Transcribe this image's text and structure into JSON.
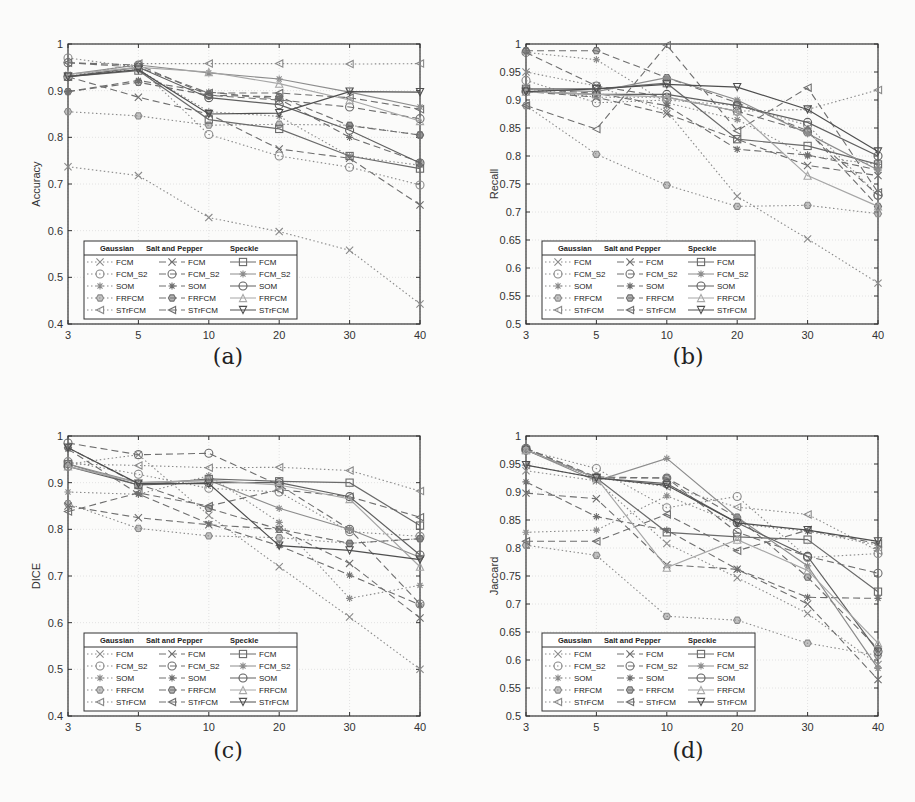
{
  "figure": {
    "captions": [
      "(a)",
      "(b)",
      "(c)",
      "(d)"
    ]
  },
  "legend": {
    "headers": [
      "Gaussian",
      "Salt and Pepper",
      "Speckle"
    ],
    "methods": [
      "FCM",
      "FCM_S2",
      "SOM",
      "FRFCM",
      "STrFCM"
    ]
  },
  "chart_data": [
    {
      "id": "a",
      "type": "line",
      "caption": "(a)",
      "title": "",
      "xlabel": "Noise Density",
      "ylabel": "Accuracy",
      "x": [
        3,
        5,
        10,
        20,
        30,
        40
      ],
      "xticks": [
        "3",
        "5",
        "10",
        "20",
        "30",
        "40"
      ],
      "ylim": [
        0.4,
        1.0
      ],
      "yticks": [
        "0.4",
        "0.5",
        "0.6",
        "0.7",
        "0.8",
        "0.9",
        "1"
      ],
      "grid": true,
      "legend_position": "lower left",
      "series": [
        {
          "name": "Gaussian FCM",
          "noise": "Gaussian",
          "method": "FCM",
          "values": [
            0.737,
            0.718,
            0.628,
            0.598,
            0.558,
            0.443
          ]
        },
        {
          "name": "Gaussian FCM_S2",
          "noise": "Gaussian",
          "method": "FCM_S2",
          "values": [
            0.97,
            0.95,
            0.806,
            0.76,
            0.736,
            0.698
          ]
        },
        {
          "name": "Gaussian SOM",
          "noise": "Gaussian",
          "method": "SOM",
          "values": [
            0.935,
            0.945,
            0.855,
            0.845,
            0.76,
            0.74
          ]
        },
        {
          "name": "Gaussian FRFCM",
          "noise": "Gaussian",
          "method": "FRFCM",
          "values": [
            0.855,
            0.846,
            0.826,
            0.828,
            0.826,
            0.805
          ]
        },
        {
          "name": "Gaussian STrFCM",
          "noise": "Gaussian",
          "method": "STrFCM",
          "values": [
            0.93,
            0.958,
            0.958,
            0.958,
            0.957,
            0.958
          ]
        },
        {
          "name": "Salt and Pepper FCM",
          "noise": "Salt and Pepper",
          "method": "FCM",
          "values": [
            0.93,
            0.886,
            0.85,
            0.775,
            0.755,
            0.655
          ]
        },
        {
          "name": "Salt and Pepper FCM_S2",
          "noise": "Salt and Pepper",
          "method": "FCM_S2",
          "values": [
            0.96,
            0.955,
            0.89,
            0.88,
            0.865,
            0.84
          ]
        },
        {
          "name": "Salt and Pepper SOM",
          "noise": "Salt and Pepper",
          "method": "SOM",
          "values": [
            0.898,
            0.922,
            0.897,
            0.882,
            0.8,
            0.747
          ]
        },
        {
          "name": "Salt and Pepper FRFCM",
          "noise": "Salt and Pepper",
          "method": "FRFCM",
          "values": [
            0.898,
            0.918,
            0.89,
            0.887,
            0.825,
            0.805
          ]
        },
        {
          "name": "Salt and Pepper STrFCM",
          "noise": "Salt and Pepper",
          "method": "STrFCM",
          "values": [
            0.96,
            0.95,
            0.895,
            0.895,
            0.885,
            0.86
          ]
        },
        {
          "name": "Speckle FCM",
          "noise": "Speckle",
          "method": "FCM",
          "values": [
            0.93,
            0.943,
            0.838,
            0.818,
            0.76,
            0.733
          ]
        },
        {
          "name": "Speckle FCM_S2",
          "noise": "Speckle",
          "method": "FCM_S2",
          "values": [
            0.935,
            0.955,
            0.938,
            0.925,
            0.897,
            0.865
          ]
        },
        {
          "name": "Speckle SOM",
          "noise": "Speckle",
          "method": "SOM",
          "values": [
            0.93,
            0.95,
            0.885,
            0.87,
            0.815,
            0.745
          ]
        },
        {
          "name": "Speckle FRFCM",
          "noise": "Speckle",
          "method": "FRFCM",
          "values": [
            0.935,
            0.95,
            0.94,
            0.915,
            0.88,
            0.835
          ]
        },
        {
          "name": "Speckle STrFCM",
          "noise": "Speckle",
          "method": "STrFCM",
          "values": [
            0.93,
            0.945,
            0.85,
            0.852,
            0.898,
            0.897
          ]
        }
      ]
    },
    {
      "id": "b",
      "type": "line",
      "caption": "(b)",
      "title": "",
      "xlabel": "Noise Density",
      "ylabel": "Recall",
      "x": [
        3,
        5,
        10,
        20,
        30,
        40
      ],
      "xticks": [
        "3",
        "5",
        "10",
        "20",
        "30",
        "40"
      ],
      "ylim": [
        0.5,
        1.0
      ],
      "yticks": [
        "0.5",
        "0.55",
        "0.6",
        "0.65",
        "0.7",
        "0.75",
        "0.8",
        "0.85",
        "0.9",
        "0.95",
        "1"
      ],
      "grid": true,
      "legend_position": "lower left",
      "series": [
        {
          "name": "Gaussian FCM",
          "noise": "Gaussian",
          "method": "FCM",
          "values": [
            0.95,
            0.925,
            0.88,
            0.728,
            0.652,
            0.573
          ]
        },
        {
          "name": "Gaussian FCM_S2",
          "noise": "Gaussian",
          "method": "FCM_S2",
          "values": [
            0.935,
            0.895,
            0.9,
            0.89,
            0.855,
            0.73
          ]
        },
        {
          "name": "Gaussian SOM",
          "noise": "Gaussian",
          "method": "SOM",
          "values": [
            0.985,
            0.972,
            0.895,
            0.865,
            0.8,
            0.785
          ]
        },
        {
          "name": "Gaussian FRFCM",
          "noise": "Gaussian",
          "method": "FRFCM",
          "values": [
            0.89,
            0.803,
            0.748,
            0.71,
            0.712,
            0.697
          ]
        },
        {
          "name": "Gaussian STrFCM",
          "noise": "Gaussian",
          "method": "STrFCM",
          "values": [
            0.92,
            0.905,
            0.905,
            0.88,
            0.883,
            0.918
          ]
        },
        {
          "name": "Salt and Pepper FCM",
          "noise": "Salt and Pepper",
          "method": "FCM",
          "values": [
            0.915,
            0.905,
            0.875,
            0.83,
            0.783,
            0.765
          ]
        },
        {
          "name": "Salt and Pepper FCM_S2",
          "noise": "Salt and Pepper",
          "method": "FCM_S2",
          "values": [
            0.985,
            0.925,
            0.905,
            0.88,
            0.843,
            0.73
          ]
        },
        {
          "name": "Salt and Pepper SOM",
          "noise": "Salt and Pepper",
          "method": "SOM",
          "values": [
            0.92,
            0.912,
            0.89,
            0.812,
            0.802,
            0.775
          ]
        },
        {
          "name": "Salt and Pepper FRFCM",
          "noise": "Salt and Pepper",
          "method": "FRFCM",
          "values": [
            0.988,
            0.988,
            0.94,
            0.895,
            0.845,
            0.71
          ]
        },
        {
          "name": "Salt and Pepper STrFCM",
          "noise": "Salt and Pepper",
          "method": "STrFCM",
          "values": [
            0.89,
            0.848,
            0.998,
            0.845,
            0.922,
            0.735
          ]
        },
        {
          "name": "Speckle FCM",
          "noise": "Speckle",
          "method": "FCM",
          "values": [
            0.92,
            0.92,
            0.93,
            0.83,
            0.818,
            0.785
          ]
        },
        {
          "name": "Speckle FCM_S2",
          "noise": "Speckle",
          "method": "FCM_S2",
          "values": [
            0.92,
            0.915,
            0.94,
            0.9,
            0.84,
            0.775
          ]
        },
        {
          "name": "Speckle SOM",
          "noise": "Speckle",
          "method": "SOM",
          "values": [
            0.915,
            0.91,
            0.91,
            0.89,
            0.86,
            0.8
          ]
        },
        {
          "name": "Speckle FRFCM",
          "noise": "Speckle",
          "method": "FRFCM",
          "values": [
            0.915,
            0.91,
            0.905,
            0.88,
            0.765,
            0.71
          ]
        },
        {
          "name": "Speckle STrFCM",
          "noise": "Speckle",
          "method": "STrFCM",
          "values": [
            0.915,
            0.92,
            0.928,
            0.923,
            0.883,
            0.808
          ]
        }
      ]
    },
    {
      "id": "c",
      "type": "line",
      "caption": "(c)",
      "title": "",
      "xlabel": "Noise Density",
      "ylabel": "DICE",
      "x": [
        3,
        5,
        10,
        20,
        30,
        40
      ],
      "xticks": [
        "3",
        "5",
        "10",
        "20",
        "30",
        "40"
      ],
      "ylim": [
        0.4,
        1.0
      ],
      "yticks": [
        "0.4",
        "0.5",
        "0.6",
        "0.7",
        "0.8",
        "0.9",
        "1"
      ],
      "grid": true,
      "legend_position": "lower left",
      "series": [
        {
          "name": "Gaussian FCM",
          "noise": "Gaussian",
          "method": "FCM",
          "values": [
            0.94,
            0.96,
            0.83,
            0.72,
            0.612,
            0.5
          ]
        },
        {
          "name": "Gaussian FCM_S2",
          "noise": "Gaussian",
          "method": "FCM_S2",
          "values": [
            0.945,
            0.918,
            0.888,
            0.88,
            0.795,
            0.785
          ]
        },
        {
          "name": "Gaussian SOM",
          "noise": "Gaussian",
          "method": "SOM",
          "values": [
            0.88,
            0.875,
            0.915,
            0.815,
            0.652,
            0.68
          ]
        },
        {
          "name": "Gaussian FRFCM",
          "noise": "Gaussian",
          "method": "FRFCM",
          "values": [
            0.855,
            0.802,
            0.786,
            0.782,
            0.77,
            0.78
          ]
        },
        {
          "name": "Gaussian STrFCM",
          "noise": "Gaussian",
          "method": "STrFCM",
          "values": [
            0.94,
            0.937,
            0.932,
            0.933,
            0.926,
            0.882
          ]
        },
        {
          "name": "Salt and Pepper FCM",
          "noise": "Salt and Pepper",
          "method": "FCM",
          "values": [
            0.85,
            0.825,
            0.81,
            0.8,
            0.727,
            0.61
          ]
        },
        {
          "name": "Salt and Pepper FCM_S2",
          "noise": "Salt and Pepper",
          "method": "FCM_S2",
          "values": [
            0.985,
            0.96,
            0.963,
            0.895,
            0.8,
            0.64
          ]
        },
        {
          "name": "Salt and Pepper SOM",
          "noise": "Salt and Pepper",
          "method": "SOM",
          "values": [
            0.972,
            0.876,
            0.812,
            0.765,
            0.702,
            0.638
          ]
        },
        {
          "name": "Salt and Pepper FRFCM",
          "noise": "Salt and Pepper",
          "method": "FRFCM",
          "values": [
            0.975,
            0.897,
            0.845,
            0.8,
            0.77,
            0.78
          ]
        },
        {
          "name": "Salt and Pepper STrFCM",
          "noise": "Salt and Pepper",
          "method": "STrFCM",
          "values": [
            0.838,
            0.878,
            0.85,
            0.885,
            0.87,
            0.826
          ]
        },
        {
          "name": "Speckle FCM",
          "noise": "Speckle",
          "method": "FCM",
          "values": [
            0.94,
            0.895,
            0.908,
            0.903,
            0.9,
            0.808
          ]
        },
        {
          "name": "Speckle FCM_S2",
          "noise": "Speckle",
          "method": "FCM_S2",
          "values": [
            0.94,
            0.9,
            0.905,
            0.845,
            0.8,
            0.74
          ]
        },
        {
          "name": "Speckle SOM",
          "noise": "Speckle",
          "method": "SOM",
          "values": [
            0.935,
            0.895,
            0.9,
            0.9,
            0.87,
            0.745
          ]
        },
        {
          "name": "Speckle FRFCM",
          "noise": "Speckle",
          "method": "FRFCM",
          "values": [
            0.935,
            0.9,
            0.905,
            0.895,
            0.865,
            0.72
          ]
        },
        {
          "name": "Speckle STrFCM",
          "noise": "Speckle",
          "method": "STrFCM",
          "values": [
            0.975,
            0.898,
            0.898,
            0.765,
            0.755,
            0.735
          ]
        }
      ]
    },
    {
      "id": "d",
      "type": "line",
      "caption": "(d)",
      "title": "",
      "xlabel": "Noise Density",
      "ylabel": "Jaccard",
      "x": [
        3,
        5,
        10,
        20,
        30,
        40
      ],
      "xticks": [
        "3",
        "5",
        "10",
        "20",
        "30",
        "40"
      ],
      "ylim": [
        0.5,
        1.0
      ],
      "yticks": [
        "0.5",
        "0.55",
        "0.6",
        "0.65",
        "0.7",
        "0.75",
        "0.8",
        "0.85",
        "0.9",
        "0.95",
        "1"
      ],
      "grid": true,
      "legend_position": "lower left",
      "series": [
        {
          "name": "Gaussian FCM",
          "noise": "Gaussian",
          "method": "FCM",
          "values": [
            0.938,
            0.92,
            0.808,
            0.747,
            0.683,
            0.592
          ]
        },
        {
          "name": "Gaussian FCM_S2",
          "noise": "Gaussian",
          "method": "FCM_S2",
          "values": [
            0.975,
            0.942,
            0.872,
            0.892,
            0.783,
            0.79
          ]
        },
        {
          "name": "Gaussian SOM",
          "noise": "Gaussian",
          "method": "SOM",
          "values": [
            0.828,
            0.832,
            0.893,
            0.843,
            0.83,
            0.805
          ]
        },
        {
          "name": "Gaussian FRFCM",
          "noise": "Gaussian",
          "method": "FRFCM",
          "values": [
            0.805,
            0.787,
            0.678,
            0.671,
            0.63,
            0.608
          ]
        },
        {
          "name": "Gaussian STrFCM",
          "noise": "Gaussian",
          "method": "STrFCM",
          "values": [
            0.948,
            0.925,
            0.91,
            0.873,
            0.86,
            0.795
          ]
        },
        {
          "name": "Salt and Pepper FCM",
          "noise": "Salt and Pepper",
          "method": "FCM",
          "values": [
            0.898,
            0.888,
            0.77,
            0.762,
            0.7,
            0.565
          ]
        },
        {
          "name": "Salt and Pepper FCM_S2",
          "noise": "Salt and Pepper",
          "method": "FCM_S2",
          "values": [
            0.978,
            0.925,
            0.925,
            0.828,
            0.785,
            0.755
          ]
        },
        {
          "name": "Salt and Pepper SOM",
          "noise": "Salt and Pepper",
          "method": "SOM",
          "values": [
            0.918,
            0.856,
            0.832,
            0.762,
            0.712,
            0.71
          ]
        },
        {
          "name": "Salt and Pepper FRFCM",
          "noise": "Salt and Pepper",
          "method": "FRFCM",
          "values": [
            0.978,
            0.927,
            0.925,
            0.855,
            0.748,
            0.62
          ]
        },
        {
          "name": "Salt and Pepper STrFCM",
          "noise": "Salt and Pepper",
          "method": "STrFCM",
          "values": [
            0.812,
            0.812,
            0.86,
            0.795,
            0.832,
            0.808
          ]
        },
        {
          "name": "Speckle FCM",
          "noise": "Speckle",
          "method": "FCM",
          "values": [
            0.975,
            0.925,
            0.828,
            0.82,
            0.815,
            0.722
          ]
        },
        {
          "name": "Speckle FCM_S2",
          "noise": "Speckle",
          "method": "FCM_S2",
          "values": [
            0.975,
            0.92,
            0.96,
            0.855,
            0.768,
            0.585
          ]
        },
        {
          "name": "Speckle SOM",
          "noise": "Speckle",
          "method": "SOM",
          "values": [
            0.975,
            0.925,
            0.915,
            0.845,
            0.785,
            0.615
          ]
        },
        {
          "name": "Speckle FRFCM",
          "noise": "Speckle",
          "method": "FRFCM",
          "values": [
            0.975,
            0.925,
            0.765,
            0.815,
            0.76,
            0.63
          ]
        },
        {
          "name": "Speckle STrFCM",
          "noise": "Speckle",
          "method": "STrFCM",
          "values": [
            0.948,
            0.925,
            0.912,
            0.845,
            0.832,
            0.812
          ]
        }
      ]
    }
  ],
  "styles": {
    "noise_dash": {
      "Gaussian": "1.5,2.5",
      "Salt and Pepper": "7,4",
      "Speckle": ""
    },
    "noise_color": {
      "Gaussian": "#8a8a8a",
      "Salt and Pepper": "#6e6e6e",
      "Speckle": "#5a5a5a"
    },
    "method_color": {
      "FCM": "#6a6a6a",
      "FCM_S2": "#8c8c8c",
      "SOM": "#606060",
      "FRFCM": "#a6a6a6",
      "STrFCM": "#4e4e4e"
    },
    "method_marker": {
      "FCM": "x",
      "FCM_S2": "circle",
      "SOM": "star",
      "FRFCM": "hexagon",
      "STrFCM": "triangle-left"
    },
    "speckle_marker": {
      "FCM": "square",
      "FCM_S2": "star",
      "SOM": "circle",
      "FRFCM": "triangle-up",
      "STrFCM": "triangle-down"
    }
  }
}
